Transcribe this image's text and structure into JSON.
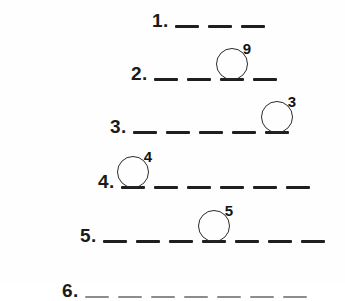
{
  "document": {
    "type": "fill-in-the-blank puzzle worksheet",
    "background_color": "#ffffff",
    "ink_color": "#1f1f1f"
  },
  "rows": [
    {
      "number_label": "1.",
      "blank_count": 3,
      "circled_index": null,
      "clue_number": null,
      "left": 152,
      "top": 2
    },
    {
      "number_label": "2.",
      "blank_count": 4,
      "circled_index": 2,
      "clue_number": "9",
      "left": 131,
      "top": 55
    },
    {
      "number_label": "3.",
      "blank_count": 5,
      "circled_index": 4,
      "clue_number": "3",
      "left": 110,
      "top": 108
    },
    {
      "number_label": "4.",
      "blank_count": 6,
      "circled_index": 0,
      "clue_number": "4",
      "left": 98,
      "top": 163
    },
    {
      "number_label": "5.",
      "blank_count": 7,
      "circled_index": 3,
      "clue_number": "5",
      "left": 80,
      "top": 217
    }
  ],
  "clipped_row": {
    "number_label": "6.",
    "blank_count": 7
  }
}
